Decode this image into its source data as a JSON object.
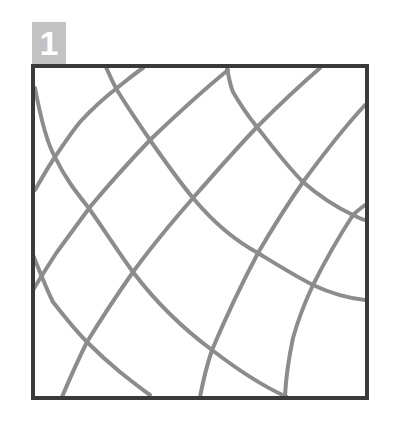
{
  "badge": {
    "label": "1",
    "color": "#c2c2c2",
    "text_color": "#ffffff"
  },
  "frame": {
    "x": 33,
    "y": 66,
    "width": 334,
    "height": 332,
    "stroke": "#3a3a3a",
    "stroke_width": 4
  },
  "curves": {
    "stroke": "#8c8c8c",
    "stroke_width": 4,
    "falling": [
      {
        "id": "a1",
        "d": "M35,88 C42,125 48,145 55,157 C65,178 76,192 88,207 C103,228 117,250 133,272 C158,305 185,330 212,350 C238,370 262,386 287,397"
      },
      {
        "id": "a2",
        "d": "M106,67 C110,76 113,83 117,90 C128,108 139,124 150,140 C164,160 178,180 193,198 C213,222 234,240 258,253 C276,264 295,276 313,285 C330,293 347,298 365,300"
      },
      {
        "id": "a3",
        "d": "M227,68 C229,78 230,85 233,92 C240,104 248,116 257,127 C272,146 287,166 303,182 C319,196 336,207 353,215 C357,217 361,219 365,220"
      },
      {
        "id": "a4",
        "d": "M33,255 C40,272 46,288 53,302 C64,316 75,330 87,342 C98,353 109,363 120,372 C130,380 140,388 150,395"
      }
    ],
    "rising": [
      {
        "id": "b1",
        "d": "M35,190 C42,178 48,167 55,157 C63,145 71,133 80,122 C91,110 104,98 117,88 C126,81 134,74 143,68"
      },
      {
        "id": "b2",
        "d": "M33,290 C41,277 49,264 57,252 C68,237 79,222 90,207 C110,183 130,161 150,140 C175,116 200,93 228,70"
      },
      {
        "id": "b3",
        "d": "M62,397 C70,378 78,360 87,342 C101,319 117,295 133,272 C152,246 172,222 193,198 C214,174 235,150 257,127 C278,106 298,87 320,68"
      },
      {
        "id": "b4",
        "d": "M200,397 C203,381 207,365 212,350 C226,317 241,285 258,253 C272,229 287,205 303,182 C322,156 342,130 365,105"
      },
      {
        "id": "b5",
        "d": "M285,396 C286,376 289,357 293,338 C298,320 305,302 313,285 C325,261 338,238 353,215 C357,211 361,208 365,205"
      }
    ]
  }
}
